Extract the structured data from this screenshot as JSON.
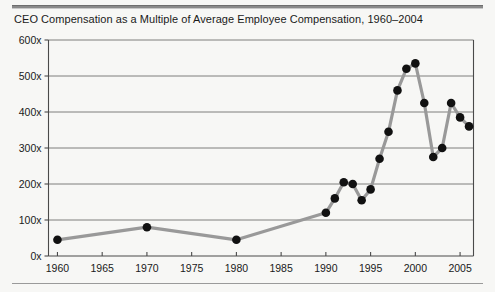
{
  "chart_data": {
    "type": "line",
    "title": "CEO Compensation as a Multiple of Average Employee Compensation, 1960–2004",
    "xlabel": "",
    "ylabel": "",
    "xlim": [
      1959,
      2006.5
    ],
    "ylim": [
      0,
      600
    ],
    "grid": true,
    "legend": "none",
    "line_color": "#999999",
    "marker_color": "#111111",
    "y_ticks": [
      0,
      100,
      200,
      300,
      400,
      500,
      600
    ],
    "y_tick_labels": [
      "0x",
      "100x",
      "200x",
      "300x",
      "400x",
      "500x",
      "600x"
    ],
    "x_ticks": [
      1960,
      1965,
      1970,
      1975,
      1980,
      1985,
      1990,
      1995,
      2000,
      2005
    ],
    "x_tick_labels": [
      "1960",
      "1965",
      "1970",
      "1975",
      "1980",
      "1985",
      "1990",
      "1995",
      "2000",
      "2005"
    ],
    "series": [
      {
        "name": "CEO pay as multiple of average employee pay",
        "x": [
          1960,
          1970,
          1980,
          1990,
          1991,
          1992,
          1993,
          1994,
          1995,
          1996,
          1997,
          1998,
          1999,
          2000,
          2001,
          2002,
          2003,
          2004,
          2005,
          2006
        ],
        "values": [
          45,
          80,
          45,
          120,
          160,
          205,
          200,
          155,
          185,
          270,
          345,
          460,
          520,
          535,
          425,
          275,
          300,
          425,
          385,
          360
        ]
      }
    ]
  },
  "figure": {
    "background_color": "#f7f7f5",
    "rule_color": "#8a8a8a"
  }
}
